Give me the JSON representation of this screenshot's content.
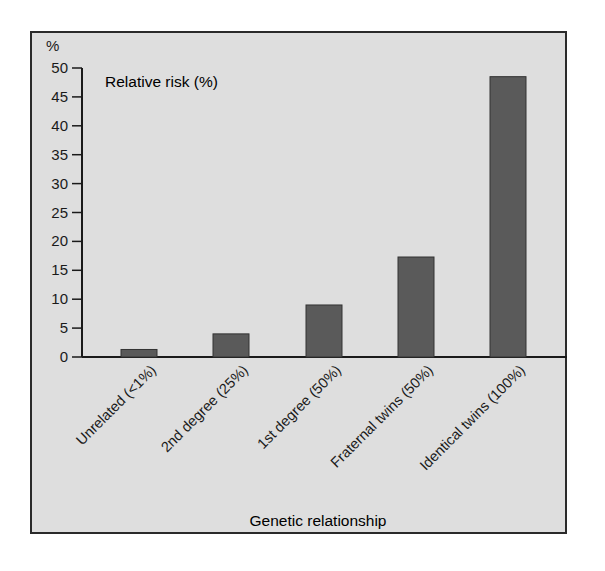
{
  "chart_data": {
    "type": "bar",
    "title": "Relative risk (%)",
    "xlabel": "Genetic relationship",
    "ylabel": "%",
    "ylim": [
      0,
      50
    ],
    "yticks": [
      0,
      5,
      10,
      15,
      20,
      25,
      30,
      35,
      40,
      45,
      50
    ],
    "grid": false,
    "legend": null,
    "categories": [
      "Unrelated (<1%)",
      "2nd degree (25%)",
      "1st degree (50%)",
      "Fraternal twins (50%)",
      "Identical twins (100%)"
    ],
    "values": [
      1.3,
      4,
      9,
      17.3,
      48.5
    ],
    "colors": {
      "bar": "#5a5a5a",
      "background": "#dedede",
      "frame": "#2a2a2a"
    }
  },
  "labels": {
    "title": "Relative risk (%)",
    "y_unit": "%",
    "x_axis": "Genetic relationship"
  }
}
